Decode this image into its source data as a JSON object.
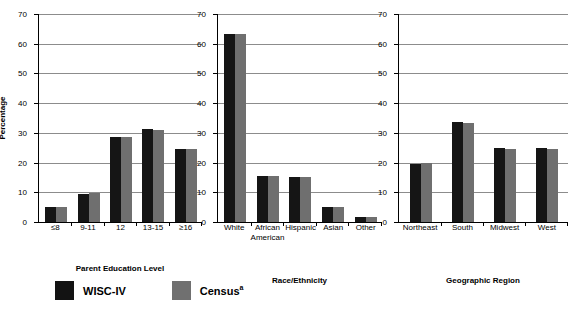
{
  "chart_data": [
    {
      "type": "bar",
      "title": "",
      "xlabel": "Parent Education Level",
      "ylabel": "Percentage",
      "ylim": [
        0,
        70
      ],
      "yticks": [
        0,
        10,
        20,
        30,
        40,
        50,
        60,
        70
      ],
      "grid": true,
      "legend_position": "bottom-left",
      "categories": [
        "≤8",
        "9-11",
        "12",
        "13-15",
        "≥16"
      ],
      "series": [
        {
          "name": "WISC-IV",
          "color": "#151515",
          "values": [
            5.2,
            9.4,
            28.5,
            31.4,
            24.6
          ]
        },
        {
          "name": "Census",
          "color": "#6f6f6f",
          "values": [
            5.2,
            9.8,
            28.6,
            31.0,
            24.6
          ]
        }
      ]
    },
    {
      "type": "bar",
      "title": "",
      "xlabel": "Race/Ethnicity",
      "ylabel": "",
      "ylim": [
        0,
        70
      ],
      "yticks": [
        0,
        10,
        20,
        30,
        40,
        50,
        60,
        70
      ],
      "grid": true,
      "categories": [
        "White",
        "African\nAmerican",
        "Hispanic",
        "Asian",
        "Other"
      ],
      "series": [
        {
          "name": "WISC-IV",
          "color": "#151515",
          "values": [
            63.2,
            15.6,
            15.2,
            4.9,
            1.7
          ]
        },
        {
          "name": "Census",
          "color": "#6f6f6f",
          "values": [
            63.2,
            15.6,
            15.1,
            4.9,
            1.7
          ]
        }
      ]
    },
    {
      "type": "bar",
      "title": "",
      "xlabel": "Geographic Region",
      "ylabel": "",
      "ylim": [
        0,
        70
      ],
      "yticks": [
        0,
        10,
        20,
        30,
        40,
        50,
        60,
        70
      ],
      "grid": true,
      "categories": [
        "Northeast",
        "South",
        "Midwest",
        "West"
      ],
      "series": [
        {
          "name": "WISC-IV",
          "color": "#151515",
          "values": [
            19.4,
            33.8,
            24.8,
            24.9
          ]
        },
        {
          "name": "Census",
          "color": "#6f6f6f",
          "values": [
            19.9,
            33.3,
            24.7,
            24.5
          ]
        }
      ]
    }
  ],
  "axis": {
    "y_title": "Percentage",
    "tick_labels": [
      "70",
      "60",
      "50",
      "40",
      "30",
      "20",
      "10",
      "0"
    ]
  },
  "panels": [
    {
      "x_title": "Parent Education Level",
      "cats": [
        "≤8",
        "9-11",
        "12",
        "13-15",
        "≥16"
      ]
    },
    {
      "x_title": "Race/Ethnicity",
      "cats": [
        "White",
        "African",
        "Hispanic",
        "Asian",
        "Other"
      ],
      "cats_line2": [
        "",
        "American",
        "",
        "",
        ""
      ]
    },
    {
      "x_title": "Geographic Region",
      "cats": [
        "Northeast",
        "South",
        "Midwest",
        "West"
      ]
    }
  ],
  "legend": {
    "items": [
      {
        "label": "WISC-IV",
        "sup": "",
        "color": "#131313"
      },
      {
        "label": "Census",
        "sup": "a",
        "color": "#707070"
      }
    ]
  }
}
